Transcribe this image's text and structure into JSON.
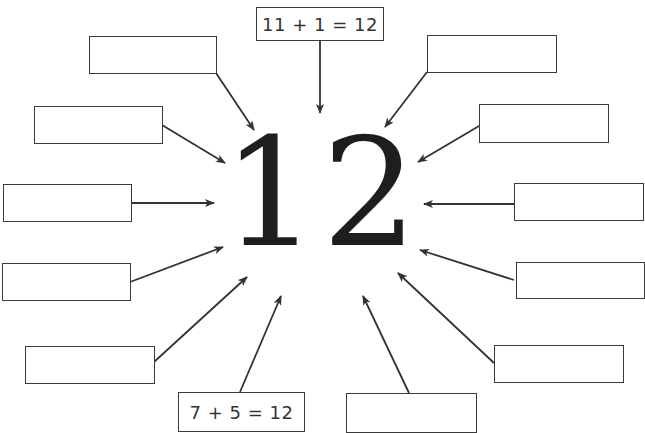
{
  "diagram": {
    "center_number": "12",
    "colors": {
      "line": "#333333",
      "text": "#333333",
      "number": "#1e1e1e",
      "background": "#ffffff"
    },
    "boxes": [
      {
        "id": "top",
        "label": "11 + 1 = 12",
        "x": 256,
        "y": 7,
        "w": 128,
        "h": 34
      },
      {
        "id": "left-1",
        "label": "",
        "x": 89,
        "y": 36,
        "w": 128,
        "h": 38
      },
      {
        "id": "left-2",
        "label": "",
        "x": 34,
        "y": 106,
        "w": 129,
        "h": 38
      },
      {
        "id": "left-3",
        "label": "",
        "x": 3,
        "y": 184,
        "w": 129,
        "h": 38
      },
      {
        "id": "left-4",
        "label": "",
        "x": 2,
        "y": 263,
        "w": 129,
        "h": 38
      },
      {
        "id": "left-5",
        "label": "",
        "x": 25,
        "y": 346,
        "w": 130,
        "h": 38
      },
      {
        "id": "bottom-left",
        "label": "7 + 5 = 12",
        "x": 178,
        "y": 392,
        "w": 127,
        "h": 40
      },
      {
        "id": "bottom-right",
        "label": "",
        "x": 346,
        "y": 393,
        "w": 131,
        "h": 40
      },
      {
        "id": "right-1",
        "label": "",
        "x": 427,
        "y": 35,
        "w": 130,
        "h": 38
      },
      {
        "id": "right-2",
        "label": "",
        "x": 479,
        "y": 104,
        "w": 130,
        "h": 39
      },
      {
        "id": "right-3",
        "label": "",
        "x": 514,
        "y": 183,
        "w": 130,
        "h": 38
      },
      {
        "id": "right-4",
        "label": "",
        "x": 516,
        "y": 262,
        "w": 129,
        "h": 37
      },
      {
        "id": "right-5",
        "label": "",
        "x": 494,
        "y": 345,
        "w": 130,
        "h": 38
      }
    ],
    "arrows": [
      {
        "from": "top",
        "x1": 320,
        "y1": 41,
        "x2": 320,
        "y2": 113
      },
      {
        "from": "left-1",
        "x1": 216,
        "y1": 73,
        "x2": 254,
        "y2": 130
      },
      {
        "from": "left-2",
        "x1": 162,
        "y1": 125,
        "x2": 225,
        "y2": 163
      },
      {
        "from": "left-3",
        "x1": 131,
        "y1": 203,
        "x2": 214,
        "y2": 203
      },
      {
        "from": "left-4",
        "x1": 130,
        "y1": 282,
        "x2": 223,
        "y2": 247
      },
      {
        "from": "left-5",
        "x1": 154,
        "y1": 362,
        "x2": 247,
        "y2": 277
      },
      {
        "from": "bottom-left",
        "x1": 240,
        "y1": 392,
        "x2": 281,
        "y2": 296
      },
      {
        "from": "bottom-right",
        "x1": 409,
        "y1": 393,
        "x2": 363,
        "y2": 296
      },
      {
        "from": "right-1",
        "x1": 427,
        "y1": 72,
        "x2": 385,
        "y2": 127
      },
      {
        "from": "right-2",
        "x1": 479,
        "y1": 126,
        "x2": 418,
        "y2": 162
      },
      {
        "from": "right-3",
        "x1": 514,
        "y1": 204,
        "x2": 424,
        "y2": 204
      },
      {
        "from": "right-4",
        "x1": 514,
        "y1": 280,
        "x2": 420,
        "y2": 250
      },
      {
        "from": "right-5",
        "x1": 494,
        "y1": 363,
        "x2": 398,
        "y2": 273
      }
    ]
  }
}
